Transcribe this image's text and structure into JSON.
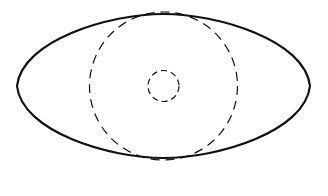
{
  "diagram": {
    "background": "#ffffff",
    "stroke_color": "#111111",
    "outer_shape": {
      "kind": "lens-ellipse",
      "center": [
        163.5,
        86
      ],
      "left_x": 17,
      "right_x": 310,
      "top_y": 14,
      "bottom_y": 158,
      "stroke_width": 2.2,
      "style": "solid"
    },
    "large_circle": {
      "center": [
        163.5,
        86
      ],
      "radius": 74,
      "stroke_width": 1.2,
      "style": "dashed",
      "dash": "9 6"
    },
    "small_circle": {
      "center": [
        163.5,
        86
      ],
      "radius": 15.5,
      "stroke_width": 1.2,
      "style": "dashed",
      "dash": "6 4"
    }
  }
}
